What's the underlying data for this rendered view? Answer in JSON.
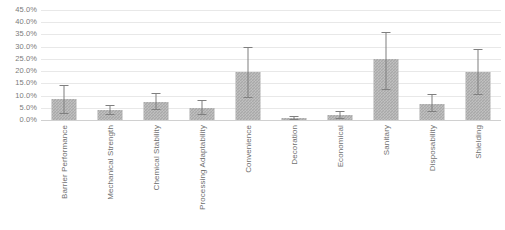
{
  "chart_data": {
    "type": "bar",
    "title": "",
    "subtitle": "",
    "xlabel": "",
    "ylabel": "",
    "grid": true,
    "legend": false,
    "orientation": "vertical",
    "value_format": "percent",
    "ylim": [
      0,
      45
    ],
    "ytick_labels": [
      "45.0%",
      "40.0%",
      "35.0%",
      "30.0%",
      "25.0%",
      "20.0%",
      "15.0%",
      "10.0%",
      "5.0%",
      "0.0%"
    ],
    "ytick_values": [
      45,
      40,
      35,
      30,
      25,
      20,
      15,
      10,
      5,
      0
    ],
    "categories": [
      "Barrier Performance",
      "Mechanical Strength",
      "Chemical Stability",
      "Processing Adaptability",
      "Convenience",
      "Decoration",
      "Economical",
      "Sanitary",
      "Disposability",
      "Shielding"
    ],
    "values": [
      8.5,
      4.0,
      7.5,
      5.0,
      19.7,
      1.0,
      2.0,
      25.0,
      6.5,
      19.5
    ],
    "error_high": [
      14.5,
      6.0,
      11.0,
      8.0,
      29.8,
      1.8,
      3.5,
      36.0,
      10.5,
      29.0
    ],
    "error_low": [
      3.0,
      2.5,
      4.5,
      2.5,
      9.5,
      0.4,
      0.8,
      12.5,
      3.5,
      10.5
    ],
    "series": [
      {
        "name": "Importance",
        "values": [
          8.5,
          4.0,
          7.5,
          5.0,
          19.7,
          1.0,
          2.0,
          25.0,
          6.5,
          19.5
        ]
      }
    ],
    "colors": {
      "bar_fill": "#a9a9a9",
      "error_bar": "#7f7f7f",
      "gridline": "#e8e8e8",
      "axis_text": "#7b7b7b",
      "background": "#ffffff"
    }
  }
}
